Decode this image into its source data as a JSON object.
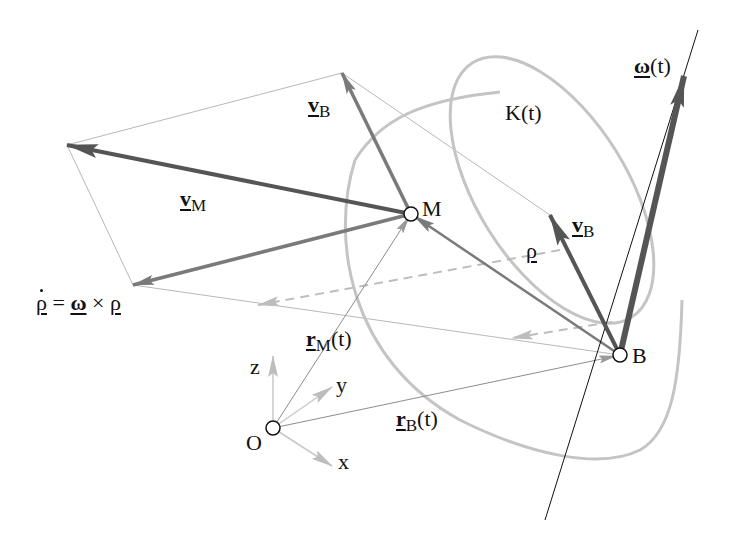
{
  "figure": {
    "colors": {
      "background": "#ffffff",
      "dark_arrow": "#555555",
      "mid_arrow": "#7a7a7a",
      "light_arrow": "#bdbdbd",
      "cylinder": "#c4c4c4",
      "thin_line": "#b5b5b5",
      "text": "#111111"
    },
    "points": {
      "M": {
        "label": "M",
        "x": 411,
        "y": 214
      },
      "B": {
        "label": "B",
        "x": 620,
        "y": 355
      },
      "O": {
        "label": "O",
        "x": 273,
        "y": 428
      }
    },
    "labels": {
      "v_B_top": {
        "base": "v",
        "sub": "B"
      },
      "v_M": {
        "base": "v",
        "sub": "M"
      },
      "v_B_right": {
        "base": "v",
        "sub": "B"
      },
      "rho": {
        "base": "ρ"
      },
      "rho_dot_eq": {
        "lhs": "ρ",
        "eq": "=",
        "omega": "ω",
        "cross": "×",
        "rhs": "ρ"
      },
      "r_M": {
        "base": "r",
        "sub": "M",
        "arg": "(t)"
      },
      "r_B": {
        "base": "r",
        "sub": "B",
        "arg": "(t)"
      },
      "K": {
        "text": "K(t)"
      },
      "omega": {
        "base": "ω",
        "arg": "(t)"
      },
      "axis_x": "x",
      "axis_y": "y",
      "axis_z": "z"
    },
    "vectors": [
      {
        "name": "v_M",
        "from": "M",
        "to": [
          67,
          145
        ],
        "style": "dark"
      },
      {
        "name": "v_B_at_M",
        "from": "M",
        "to": [
          342,
          73
        ],
        "style": "mid"
      },
      {
        "name": "rho_dot",
        "from": "M",
        "to": [
          133,
          285
        ],
        "style": "mid"
      },
      {
        "name": "v_B",
        "from": "B",
        "to": [
          550,
          215
        ],
        "style": "dark"
      },
      {
        "name": "omega",
        "from": "B",
        "to": [
          683,
          78
        ],
        "style": "dark"
      },
      {
        "name": "rho",
        "from": "B",
        "to": "M",
        "style": "mid"
      },
      {
        "name": "r_M",
        "from": "O",
        "to": "M",
        "style": "thin"
      },
      {
        "name": "r_B",
        "from": "O",
        "to": "B",
        "style": "thin"
      }
    ]
  }
}
